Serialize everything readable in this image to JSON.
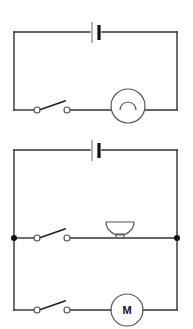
{
  "figure": {
    "kind": "electrical-circuit-diagram",
    "background_color": "#ffffff",
    "wire_color": "#333333",
    "component_color": "#555555",
    "width": 193,
    "height": 329
  },
  "circuits": [
    {
      "id": "top-circuit",
      "name": "lamp-circuit",
      "description": "Series circuit with one cell, one open switch and one lamp",
      "bounds": {
        "left": 14,
        "top": 32,
        "right": 177,
        "bottom": 110
      },
      "components": [
        {
          "type": "cell",
          "name": "battery-cell",
          "label": "",
          "position": {
            "x": 97,
            "y": 32
          },
          "orientation": "horizontal",
          "plate_long_x": 92,
          "plate_short_x": 99
        },
        {
          "type": "switch",
          "name": "open-switch",
          "label": "",
          "state": "open",
          "left_terminal": {
            "x": 37,
            "y": 110
          },
          "right_terminal": {
            "x": 67,
            "y": 110
          },
          "blade_tip": {
            "x": 65,
            "y": 101
          }
        },
        {
          "type": "lamp",
          "name": "lamp",
          "label": "",
          "center": {
            "x": 128,
            "y": 106
          },
          "radius": 17,
          "filament_radius": 8
        }
      ]
    },
    {
      "id": "bottom-circuit",
      "name": "bell-and-motor-circuit",
      "description": "Parallel circuit with one cell, two open switches, a bell branch and a motor branch",
      "bounds": {
        "left": 14,
        "top": 150,
        "right": 177,
        "bottom": 310
      },
      "components": [
        {
          "type": "cell",
          "name": "battery-cell",
          "label": "",
          "position": {
            "x": 97,
            "y": 150
          },
          "orientation": "horizontal",
          "plate_long_x": 92,
          "plate_short_x": 99
        },
        {
          "type": "switch",
          "name": "open-switch-bell-branch",
          "label": "",
          "state": "open",
          "left_terminal": {
            "x": 37,
            "y": 238
          },
          "right_terminal": {
            "x": 67,
            "y": 238
          },
          "blade_tip": {
            "x": 65,
            "y": 229
          }
        },
        {
          "type": "bell",
          "name": "bell",
          "label": "",
          "center": {
            "x": 120,
            "y": 238
          },
          "dome_width": 28,
          "dome_height": 14
        },
        {
          "type": "switch",
          "name": "open-switch-motor-branch",
          "label": "",
          "state": "open",
          "left_terminal": {
            "x": 37,
            "y": 301
          },
          "right_terminal": {
            "x": 67,
            "y": 301
          },
          "blade_tip": {
            "x": 65,
            "y": 292
          }
        },
        {
          "type": "motor",
          "name": "motor",
          "label": "M",
          "center": {
            "x": 127,
            "y": 301
          },
          "radius": 16
        }
      ],
      "junctions": [
        {
          "name": "left-junction-node",
          "x": 14,
          "y": 238
        },
        {
          "name": "right-junction-node",
          "x": 177,
          "y": 238
        }
      ]
    }
  ]
}
